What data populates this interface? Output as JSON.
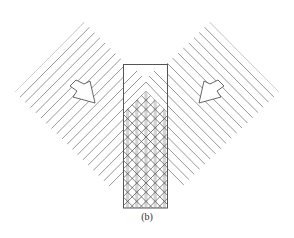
{
  "figure": {
    "caption": "(b)",
    "colors": {
      "line": "#555555",
      "hatch": "#6a6a6a",
      "stripe": "#d4d4d4",
      "background": "#ffffff"
    },
    "rectangle": {
      "x": 123,
      "y": 64,
      "width": 45,
      "height": 144
    },
    "crosshatch_region": {
      "peak": [
        146,
        91
      ],
      "bottom": 208,
      "spacing": 9.2
    },
    "left_beam": {
      "direction": "down-right",
      "line_count": 13,
      "arrow": {
        "tip": [
          95,
          103
        ],
        "label": "incident-beam-arrow-left"
      }
    },
    "right_beam": {
      "direction": "down-left",
      "line_count": 13,
      "arrow": {
        "tip": [
          198,
          103
        ],
        "label": "incident-beam-arrow-right"
      }
    }
  }
}
